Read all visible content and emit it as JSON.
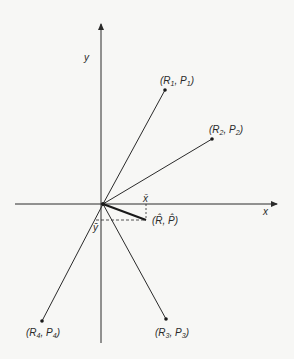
{
  "diagram": {
    "axes": {
      "x_label": "x",
      "y_label": "y",
      "origin": [
        103,
        204
      ]
    },
    "points": [
      {
        "id": "p1",
        "label_main_R": "R",
        "sub": "1",
        "label_main_P": "P",
        "pos": [
          165,
          90
        ]
      },
      {
        "id": "p2",
        "label_main_R": "R",
        "sub": "2",
        "label_main_P": "P",
        "pos": [
          212,
          139
        ]
      },
      {
        "id": "p3",
        "label_main_R": "R",
        "sub": "3",
        "label_main_P": "P",
        "pos": [
          166,
          319
        ]
      },
      {
        "id": "p4",
        "label_main_R": "R",
        "sub": "4",
        "label_main_P": "P",
        "pos": [
          42,
          321
        ]
      }
    ],
    "mean_point": {
      "label": "(R̂, P̂)",
      "pos": [
        146,
        220
      ]
    },
    "x_bar_label": "x̄",
    "y_bar_label": "ȳ",
    "colors": {
      "line": "#2a2a2a",
      "background": "#f7f7f5"
    }
  }
}
